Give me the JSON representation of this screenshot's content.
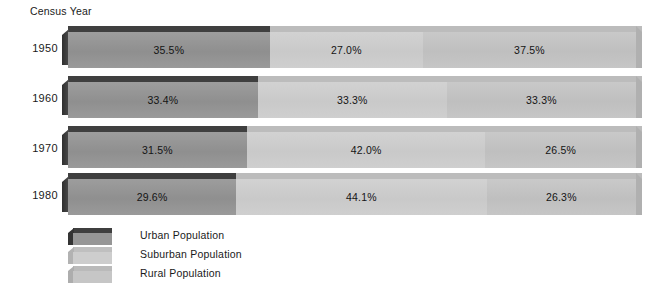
{
  "chart_data": {
    "type": "bar",
    "title": "Census Year",
    "subtitle": "",
    "xlabel": "",
    "ylabel": "Census Year",
    "orientation": "horizontal",
    "stacked": true,
    "normalized_percent": true,
    "grid": false,
    "legend_position": "bottom-left",
    "xlim": [
      0,
      100
    ],
    "categories": [
      "1950",
      "1960",
      "1970",
      "1980"
    ],
    "series": [
      {
        "name": "Urban Population",
        "color": "#969696",
        "values": [
          35.5,
          33.4,
          31.5,
          29.6
        ],
        "labels": [
          "35.5%",
          "33.4%",
          "31.5%",
          "29.6%"
        ]
      },
      {
        "name": "Suburban Population",
        "color": "#cdcdcd",
        "values": [
          27.0,
          33.3,
          42.0,
          44.1
        ],
        "labels": [
          "27.0%",
          "33.3%",
          "42.0%",
          "44.1%"
        ]
      },
      {
        "name": "Rural Population",
        "color": "#c4c4c4",
        "values": [
          37.5,
          33.3,
          26.5,
          26.3
        ],
        "labels": [
          "37.5%",
          "33.3%",
          "26.5%",
          "26.3%"
        ]
      }
    ]
  },
  "title": {
    "text": "Census Year"
  },
  "rows": [
    {
      "year": "1950",
      "segments": [
        {
          "label": "35.5%",
          "pct": 35.5,
          "series": "Urban Population"
        },
        {
          "label": "27.0%",
          "pct": 27.0,
          "series": "Suburban Population"
        },
        {
          "label": "37.5%",
          "pct": 37.5,
          "series": "Rural Population"
        }
      ]
    },
    {
      "year": "1960",
      "segments": [
        {
          "label": "33.4%",
          "pct": 33.4,
          "series": "Urban Population"
        },
        {
          "label": "33.3%",
          "pct": 33.3,
          "series": "Suburban Population"
        },
        {
          "label": "33.3%",
          "pct": 33.3,
          "series": "Rural Population"
        }
      ]
    },
    {
      "year": "1970",
      "segments": [
        {
          "label": "31.5%",
          "pct": 31.5,
          "series": "Urban Population"
        },
        {
          "label": "42.0%",
          "pct": 42.0,
          "series": "Suburban Population"
        },
        {
          "label": "26.5%",
          "pct": 26.5,
          "series": "Rural Population"
        }
      ]
    },
    {
      "year": "1980",
      "segments": [
        {
          "label": "29.6%",
          "pct": 29.6,
          "series": "Urban Population"
        },
        {
          "label": "44.1%",
          "pct": 44.1,
          "series": "Suburban Population"
        },
        {
          "label": "26.3%",
          "pct": 26.3,
          "series": "Rural Population"
        }
      ]
    }
  ],
  "legend": {
    "items": [
      {
        "label": "Urban Population",
        "color": "#969696",
        "top_color": "#3f3f3f",
        "side_color": "#343434"
      },
      {
        "label": "Suburban Population",
        "color": "#cdcdcd",
        "top_color": "#bfbfbf",
        "side_color": "#b2b2b2"
      },
      {
        "label": "Rural Population",
        "color": "#c6c6c6",
        "top_color": "#bababa",
        "side_color": "#adadad"
      }
    ]
  },
  "colors": {
    "background": "#ffffff",
    "urban": "#969696",
    "suburban": "#cdcdcd",
    "rural": "#c4c4c4",
    "urban_top": "#3f3f3f",
    "urban_side": "#343434",
    "text": "#1a1a1a"
  }
}
